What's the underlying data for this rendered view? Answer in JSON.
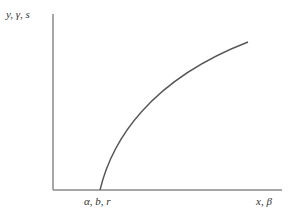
{
  "diagram": {
    "y_axis_label": "y, γ, s",
    "x_axis_label": "x, β",
    "intercept_label": "α, b, r",
    "colors": {
      "axis": "#8a8a8a",
      "curve": "#555555",
      "text": "#333333",
      "background": "#ffffff"
    }
  }
}
